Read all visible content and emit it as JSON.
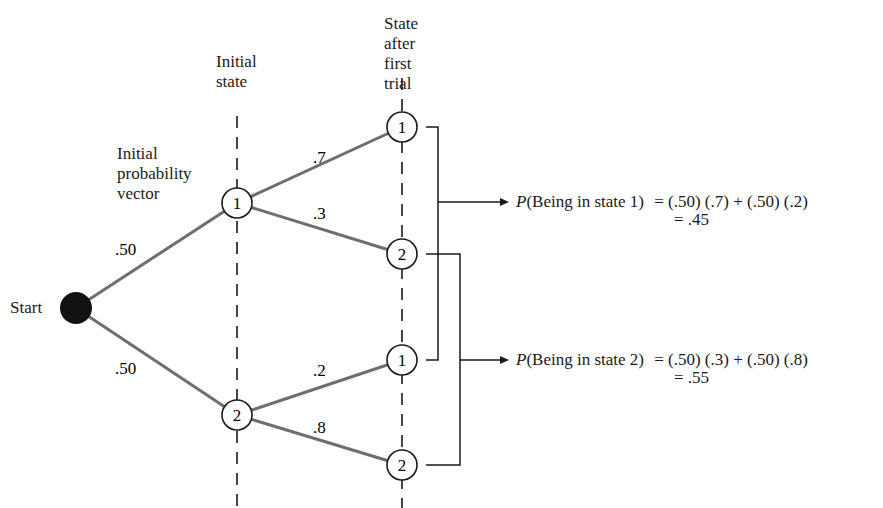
{
  "headers": {
    "initial_state": "Initial\nstate",
    "first_trial": "State\nafter\nfirst\ntrial",
    "initial_vector": "Initial\nprobability\nvector"
  },
  "start_label": "Start",
  "start_branches": [
    {
      "to": "1",
      "prob": ".50"
    },
    {
      "to": "2",
      "prob": ".50"
    }
  ],
  "initial_nodes": [
    {
      "state": "1",
      "branches": [
        {
          "to": "1",
          "prob": ".7"
        },
        {
          "to": "2",
          "prob": ".3"
        }
      ]
    },
    {
      "state": "2",
      "branches": [
        {
          "to": "1",
          "prob": ".2"
        },
        {
          "to": "2",
          "prob": ".8"
        }
      ]
    }
  ],
  "results": [
    {
      "prefix": "P",
      "event": "(Being in state 1)",
      "expr": "= (.50) (.7) + (.50) (.2)",
      "value": "= .45"
    },
    {
      "prefix": "P",
      "event": "(Being in state 2)",
      "expr": "= (.50) (.3) + (.50) (.8)",
      "value": "= .55"
    }
  ],
  "colors": {
    "branch": "#6e6e6e",
    "ink": "#1a1a1a",
    "start_fill": "#111111"
  }
}
